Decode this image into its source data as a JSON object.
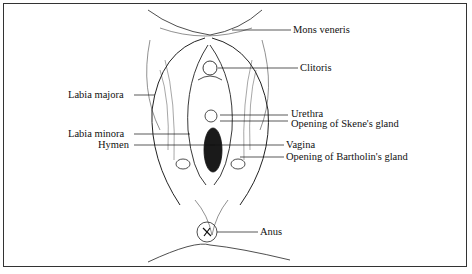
{
  "figure": {
    "type": "anatomical line drawing",
    "colors": {
      "ink": "#111111",
      "border": "#333333",
      "background": "#ffffff"
    }
  },
  "labels": {
    "mons_veneris": "Mons veneris",
    "clitoris": "Clitoris",
    "labia_majora": "Labia majora",
    "urethra": "Urethra",
    "skene": "Opening of Skene's gland",
    "labia_minora": "Labia minora",
    "vagina": "Vagina",
    "hymen": "Hymen",
    "bartholin": "Opening of Bartholin's gland",
    "anus": "Anus"
  }
}
